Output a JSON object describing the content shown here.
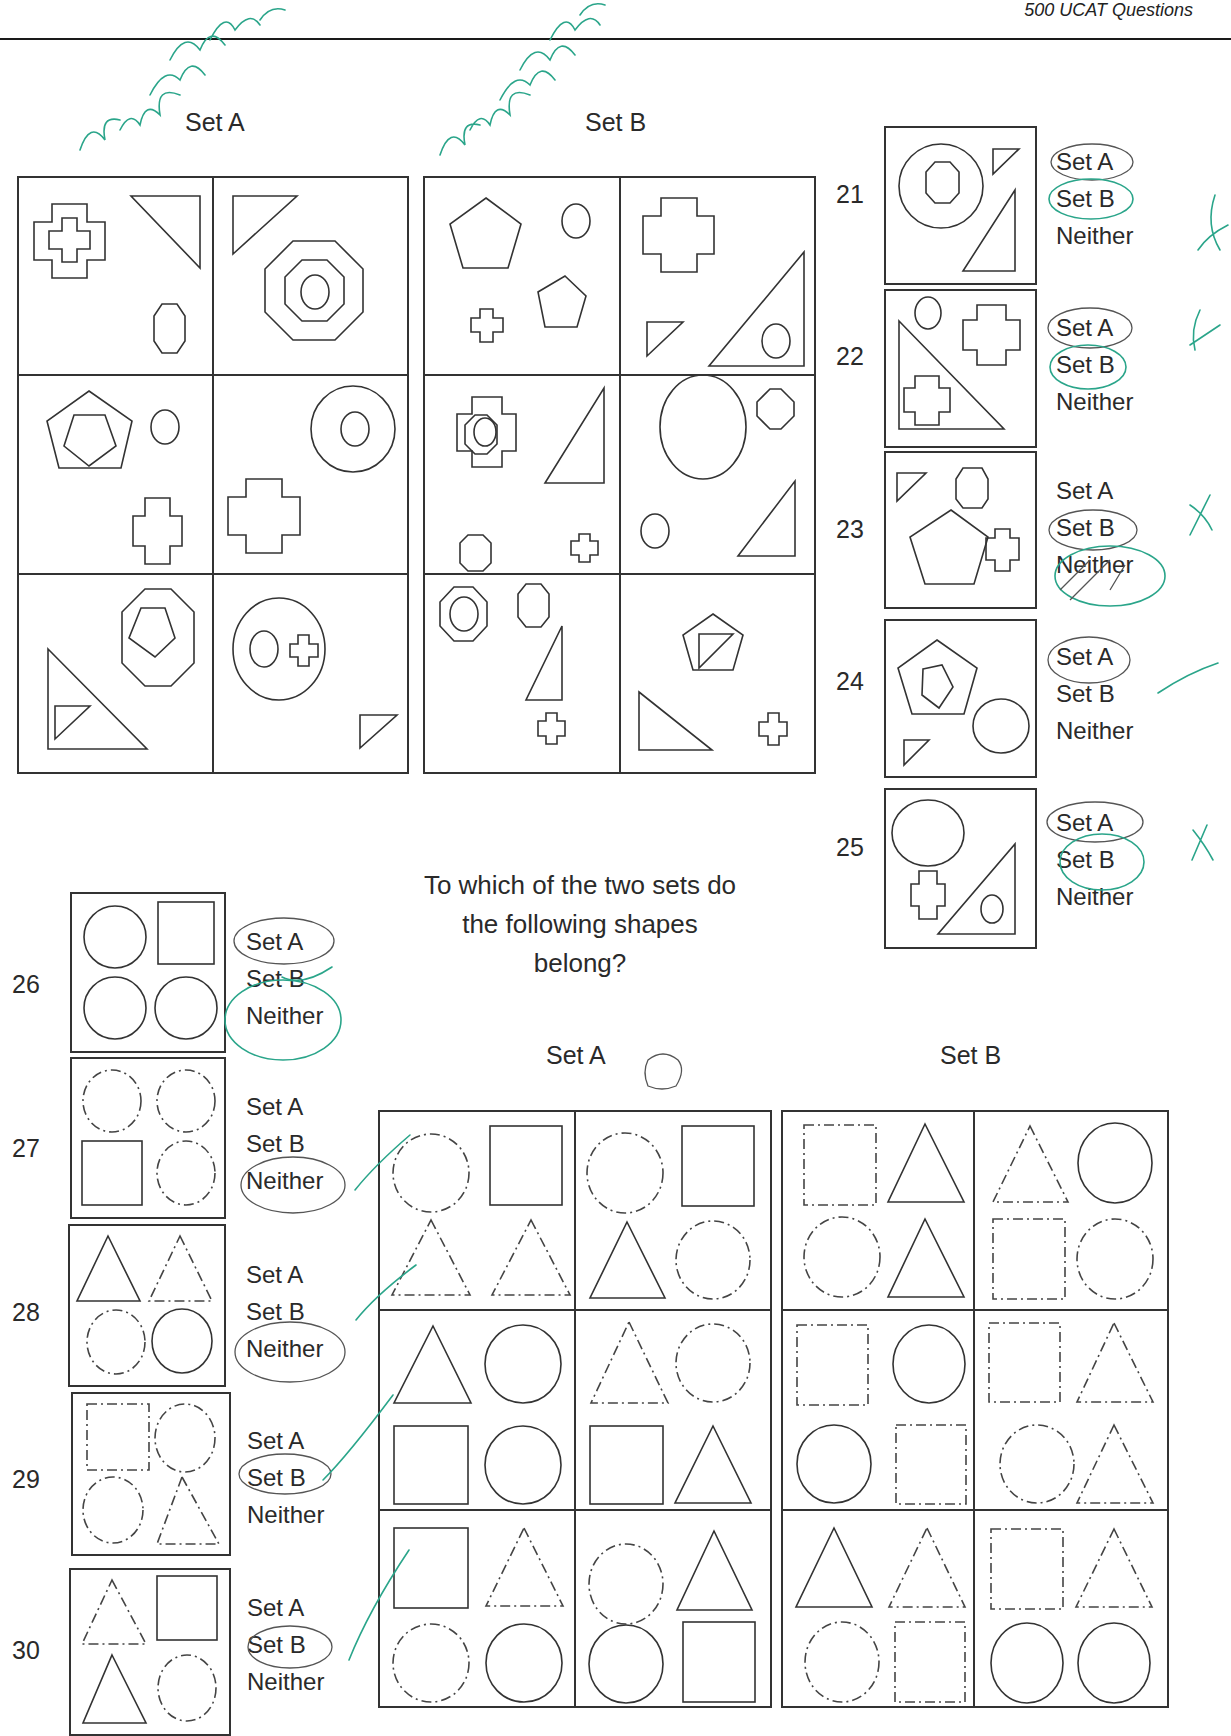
{
  "header": {
    "title": "500 UCAT Questions"
  },
  "part1": {
    "set_a_label": "Set A",
    "set_b_label": "Set B",
    "questions": [
      {
        "number": "21",
        "options": [
          "Set A",
          "Set B",
          "Neither"
        ],
        "circled_pencil": "Set A",
        "circled_pen": "Set B",
        "mark": "✗"
      },
      {
        "number": "22",
        "options": [
          "Set A",
          "Set B",
          "Neither"
        ],
        "circled_pencil": "Set A",
        "circled_pen": "Set B",
        "mark": "✗"
      },
      {
        "number": "23",
        "options": [
          "Set A",
          "Set B",
          "Neither"
        ],
        "circled_pencil": "Set B",
        "circled_pen": "Neither",
        "mark": "✗"
      },
      {
        "number": "24",
        "options": [
          "Set A",
          "Set B",
          "Neither"
        ],
        "circled_pencil": "Set A",
        "circled_pen": "",
        "mark": "✓"
      },
      {
        "number": "25",
        "options": [
          "Set A",
          "Set B",
          "Neither"
        ],
        "circled_pencil": "Set A",
        "circled_pen": "Set B",
        "mark": "✗"
      }
    ],
    "annotations": [
      "pair similar together",
      "pair similar independent"
    ]
  },
  "part2": {
    "prompt_lines": [
      "To which of the two sets do",
      "the following shapes",
      "belong?"
    ],
    "set_a_label": "Set A",
    "set_b_label": "Set B",
    "questions": [
      {
        "number": "26",
        "options": [
          "Set A",
          "Set B",
          "Neither"
        ],
        "circled_pencil": "Set A",
        "circled_pen": "Neither"
      },
      {
        "number": "27",
        "options": [
          "Set A",
          "Set B",
          "Neither"
        ],
        "circled_pencil": "Neither",
        "circled_pen": ""
      },
      {
        "number": "28",
        "options": [
          "Set A",
          "Set B",
          "Neither"
        ],
        "circled_pencil": "Neither",
        "circled_pen": ""
      },
      {
        "number": "29",
        "options": [
          "Set A",
          "Set B",
          "Neither"
        ],
        "circled_pencil": "Set B",
        "circled_pen": ""
      },
      {
        "number": "30",
        "options": [
          "Set A",
          "Set B",
          "Neither"
        ],
        "circled_pencil": "Set A",
        "circled_pen": ""
      }
    ]
  },
  "colors": {
    "ink": "#333333",
    "pen": "#2aa58a",
    "background": "#ffffff"
  }
}
